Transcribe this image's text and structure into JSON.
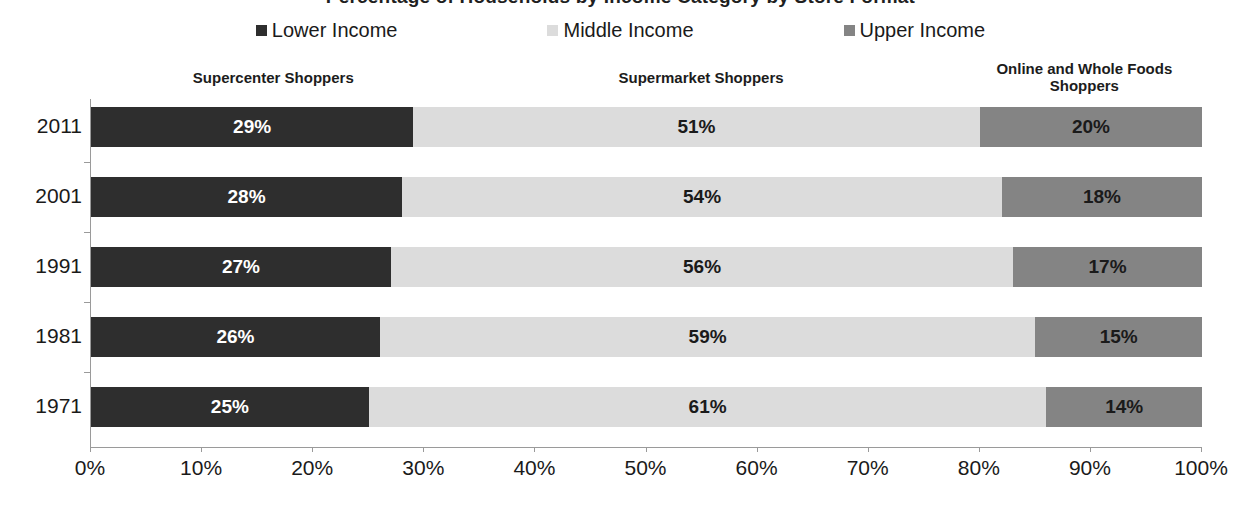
{
  "chart_data": {
    "type": "bar",
    "subtype": "100% stacked horizontal bar",
    "title": "Percentage of Households by Income Category by Store Format",
    "categories": [
      "2011",
      "2001",
      "1991",
      "1981",
      "1971"
    ],
    "series": [
      {
        "name": "Lower Income",
        "color": "#2e2e2e",
        "values": [
          29,
          28,
          27,
          26,
          25
        ],
        "labels": [
          "29%",
          "28%",
          "27%",
          "26%",
          "25%"
        ]
      },
      {
        "name": "Middle Income",
        "color": "#dcdcdc",
        "values": [
          51,
          54,
          56,
          59,
          61
        ],
        "labels": [
          "51%",
          "54%",
          "56%",
          "59%",
          "61%"
        ]
      },
      {
        "name": "Upper Income",
        "color": "#848484",
        "values": [
          20,
          18,
          17,
          15,
          14
        ],
        "labels": [
          "20%",
          "18%",
          "17%",
          "15%",
          "14%"
        ]
      }
    ],
    "xlabel": "",
    "ylabel": "",
    "xlim": [
      0,
      100
    ],
    "xticks": [
      "0%",
      "10%",
      "20%",
      "30%",
      "40%",
      "50%",
      "60%",
      "70%",
      "80%",
      "90%",
      "100%"
    ],
    "xtick_values": [
      0,
      10,
      20,
      30,
      40,
      50,
      60,
      70,
      80,
      90,
      100
    ],
    "grid": false,
    "legend_position": "top",
    "orientation": "horizontal"
  },
  "legend": {
    "items": [
      {
        "label": "Lower Income",
        "color": "#2e2e2e"
      },
      {
        "label": "Middle Income",
        "color": "#dcdcdc"
      },
      {
        "label": "Upper Income",
        "color": "#848484"
      }
    ]
  },
  "group_headers": [
    {
      "label": "Supercenter Shoppers",
      "center_pct": 16.5,
      "width_px": 300
    },
    {
      "label": "Supermarket Shoppers",
      "center_pct": 55.0,
      "width_px": 300
    },
    {
      "label": "Online and Whole Foods Shoppers",
      "center_pct": 89.5,
      "width_px": 210
    }
  ],
  "colors": {
    "lower_income": "#2e2e2e",
    "middle_income": "#dcdcdc",
    "upper_income": "#848484",
    "axis": "#9a9a9a",
    "text": "#1a1a1a",
    "background": "#ffffff"
  }
}
